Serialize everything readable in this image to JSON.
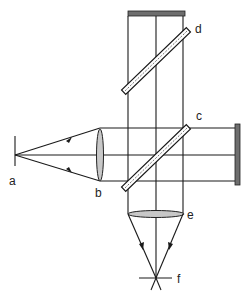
{
  "diagram": {
    "type": "optical-interferometer-schematic",
    "labels": {
      "a": "a",
      "b": "b",
      "c": "c",
      "d": "d",
      "e": "e",
      "f": "f"
    },
    "components": [
      {
        "id": "a",
        "role": "point source"
      },
      {
        "id": "b",
        "role": "collimating lens"
      },
      {
        "id": "c",
        "role": "beam splitter (lower)"
      },
      {
        "id": "d",
        "role": "beam splitter (upper)"
      },
      {
        "id": "e",
        "role": "focusing lens"
      },
      {
        "id": "f",
        "role": "focal point / detector"
      },
      {
        "id": "top-mirror",
        "role": "plane mirror (top)"
      },
      {
        "id": "right-mirror",
        "role": "plane mirror (right)"
      }
    ],
    "colors": {
      "line": "#1a1a1a",
      "mirror": "#6e6e6e",
      "lens": "#c8c8c8",
      "background": "#ffffff"
    }
  }
}
